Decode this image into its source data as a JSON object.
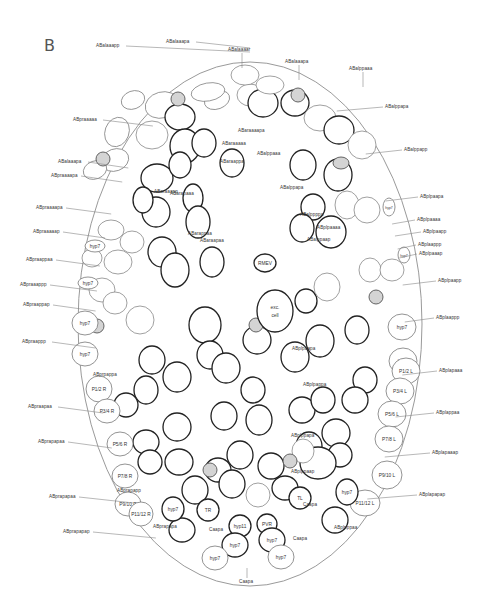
{
  "figure": {
    "panel_label": "B",
    "outline_color": "#9a9a9a",
    "cell_stroke_dark": "#222222",
    "cell_stroke_light": "#777777",
    "shaded_cell_fill": "#d4d4d4"
  },
  "outer_labels": {
    "left": [
      {
        "text": "ABalaaapp",
        "x": 96,
        "y": 44
      },
      {
        "text": "ABalaaapa",
        "x": 166,
        "y": 40
      },
      {
        "text": "ABpraaaaa",
        "x": 73,
        "y": 118
      },
      {
        "text": "ABalaaapa",
        "x": 58,
        "y": 160
      },
      {
        "text": "ABpraaaapa",
        "x": 51,
        "y": 174
      },
      {
        "text": "ABpraaaapa",
        "x": 36,
        "y": 206
      },
      {
        "text": "ABpraaaaap",
        "x": 33,
        "y": 230
      },
      {
        "text": "ABpraappaa",
        "x": 26,
        "y": 258
      },
      {
        "text": "ABpraaappp",
        "x": 20,
        "y": 283
      },
      {
        "text": "ABpraappap",
        "x": 23,
        "y": 303
      },
      {
        "text": "ABpraappp",
        "x": 22,
        "y": 340
      },
      {
        "text": "ABpraapaa",
        "x": 28,
        "y": 405
      },
      {
        "text": "ABprapapaa",
        "x": 38,
        "y": 440
      },
      {
        "text": "ABprapapaa",
        "x": 49,
        "y": 495
      },
      {
        "text": "ABprapapap",
        "x": 63,
        "y": 530
      }
    ],
    "top": [
      {
        "text": "ABalaaaar",
        "x": 228,
        "y": 48
      },
      {
        "text": "ABalaaapa",
        "x": 285,
        "y": 60
      },
      {
        "text": "ABalppaaa",
        "x": 349,
        "y": 67
      }
    ],
    "right": [
      {
        "text": "ABalppapa",
        "x": 385,
        "y": 105
      },
      {
        "text": "ABalppapp",
        "x": 404,
        "y": 148
      },
      {
        "text": "ABplpaapa",
        "x": 420,
        "y": 195
      },
      {
        "text": "ABplpaaaa",
        "x": 417,
        "y": 218
      },
      {
        "text": "ABplpaapp",
        "x": 423,
        "y": 230
      },
      {
        "text": "ABplaappp",
        "x": 418,
        "y": 243
      },
      {
        "text": "ABplpaaap",
        "x": 419,
        "y": 252
      },
      {
        "text": "ABplpaapp",
        "x": 438,
        "y": 279
      },
      {
        "text": "ABplaappp",
        "x": 436,
        "y": 316
      },
      {
        "text": "ABplapaaa",
        "x": 439,
        "y": 369
      },
      {
        "text": "ABplappaa",
        "x": 436,
        "y": 411
      },
      {
        "text": "ABplapaaap",
        "x": 432,
        "y": 451
      },
      {
        "text": "ABplapapap",
        "x": 419,
        "y": 493
      }
    ],
    "bottom": [
      {
        "text": "Caapa",
        "x": 239,
        "y": 580
      }
    ]
  },
  "inner_labels": [
    {
      "text": "ABaraaaapa",
      "x": 238,
      "y": 129
    },
    {
      "text": "ABaraaaaa",
      "x": 222,
      "y": 142
    },
    {
      "text": "ABarapaaa",
      "x": 170,
      "y": 192
    },
    {
      "text": "ABaraappa",
      "x": 220,
      "y": 160
    },
    {
      "text": "ABalppaaa",
      "x": 257,
      "y": 152
    },
    {
      "text": "ABalppapa",
      "x": 280,
      "y": 186
    },
    {
      "text": "ABarappaa",
      "x": 188,
      "y": 232
    },
    {
      "text": "ABaraapaa",
      "x": 200,
      "y": 239
    },
    {
      "text": "ABaraaapp",
      "x": 154,
      "y": 190
    },
    {
      "text": "ABalppppa",
      "x": 300,
      "y": 213
    },
    {
      "text": "ABplpaaaa",
      "x": 317,
      "y": 226
    },
    {
      "text": "ABalppaap",
      "x": 307,
      "y": 238
    },
    {
      "text": "ABplpaapa",
      "x": 292,
      "y": 347
    },
    {
      "text": "ABplpappa",
      "x": 303,
      "y": 383
    },
    {
      "text": "ABprpappa",
      "x": 93,
      "y": 373
    },
    {
      "text": "ABprapapp",
      "x": 117,
      "y": 489
    },
    {
      "text": "ABprapapa",
      "x": 153,
      "y": 525
    },
    {
      "text": "ABplppaap",
      "x": 291,
      "y": 470
    },
    {
      "text": "ABplppapa",
      "x": 291,
      "y": 434
    },
    {
      "text": "ABplpppaa",
      "x": 334,
      "y": 526
    }
  ],
  "named_cells": [
    {
      "text": "RMEV",
      "cx": 265,
      "cy": 263,
      "rx": 11,
      "ry": 9,
      "dark": true
    },
    {
      "text": "exc. cell",
      "cx": 275,
      "cy": 311,
      "rx": 18,
      "ry": 21,
      "dark": true
    },
    {
      "text": "hyp7",
      "cx": 85,
      "cy": 323,
      "rx": 13,
      "ry": 12,
      "dark": false
    },
    {
      "text": "hyp7",
      "cx": 85,
      "cy": 354,
      "rx": 13,
      "ry": 12,
      "dark": false
    },
    {
      "text": "hyp7",
      "cx": 402,
      "cy": 327,
      "rx": 14,
      "ry": 13,
      "dark": false
    },
    {
      "text": "hyp7",
      "cx": 403,
      "cy": 361,
      "rx": 14,
      "ry": 13,
      "dark": false
    },
    {
      "text": "P1/2 R",
      "cx": 99,
      "cy": 389,
      "rx": 13,
      "ry": 13,
      "dark": false
    },
    {
      "text": "P3/4 R",
      "cx": 107,
      "cy": 411,
      "rx": 13,
      "ry": 12,
      "dark": false
    },
    {
      "text": "P5/6 R",
      "cx": 120,
      "cy": 444,
      "rx": 13,
      "ry": 12,
      "dark": false
    },
    {
      "text": "P7/8 R",
      "cx": 125,
      "cy": 476,
      "rx": 13,
      "ry": 12,
      "dark": false
    },
    {
      "text": "P9/10 R",
      "cx": 128,
      "cy": 504,
      "rx": 13,
      "ry": 12,
      "dark": false
    },
    {
      "text": "P11/12 R",
      "cx": 141,
      "cy": 514,
      "rx": 12,
      "ry": 12,
      "dark": false
    },
    {
      "text": "P1/2 L",
      "cx": 406,
      "cy": 371,
      "rx": 14,
      "ry": 13,
      "dark": false
    },
    {
      "text": "P3/4 L",
      "cx": 400,
      "cy": 391,
      "rx": 14,
      "ry": 13,
      "dark": false
    },
    {
      "text": "P5/6 L",
      "cx": 392,
      "cy": 414,
      "rx": 14,
      "ry": 13,
      "dark": false
    },
    {
      "text": "P7/8 L",
      "cx": 389,
      "cy": 439,
      "rx": 14,
      "ry": 13,
      "dark": false
    },
    {
      "text": "P9/10 L",
      "cx": 387,
      "cy": 475,
      "rx": 15,
      "ry": 14,
      "dark": false
    },
    {
      "text": "P11/12 L",
      "cx": 365,
      "cy": 503,
      "rx": 15,
      "ry": 13,
      "dark": false
    },
    {
      "text": "hyp7",
      "cx": 173,
      "cy": 509,
      "rx": 11,
      "ry": 12,
      "dark": true
    },
    {
      "text": "TR",
      "cx": 208,
      "cy": 510,
      "rx": 11,
      "ry": 11,
      "dark": true
    },
    {
      "text": "TL",
      "cx": 300,
      "cy": 498,
      "rx": 11,
      "ry": 11,
      "dark": true
    },
    {
      "text": "hyp7",
      "cx": 347,
      "cy": 492,
      "rx": 11,
      "ry": 13,
      "dark": true
    },
    {
      "text": "hyp11",
      "cx": 240,
      "cy": 526,
      "rx": 11,
      "ry": 11,
      "dark": true
    },
    {
      "text": "PVR",
      "cx": 267,
      "cy": 524,
      "rx": 10,
      "ry": 10,
      "dark": true
    },
    {
      "text": "hyp7",
      "cx": 235,
      "cy": 545,
      "rx": 13,
      "ry": 12,
      "dark": true
    },
    {
      "text": "hyp7",
      "cx": 272,
      "cy": 540,
      "rx": 13,
      "ry": 12,
      "dark": true
    },
    {
      "text": "hyp7",
      "cx": 215,
      "cy": 558,
      "rx": 13,
      "ry": 12,
      "dark": false
    },
    {
      "text": "hyp7",
      "cx": 281,
      "cy": 557,
      "rx": 13,
      "ry": 12,
      "dark": false
    },
    {
      "text": "hyp7",
      "cx": 95,
      "cy": 246,
      "rx": 10,
      "ry": 6,
      "dark": false
    },
    {
      "text": "hyp7",
      "cx": 88,
      "cy": 283,
      "rx": 10,
      "ry": 6,
      "dark": false
    },
    {
      "text": "hyp7",
      "cx": 389,
      "cy": 207,
      "rx": 6,
      "ry": 9,
      "dark": false
    },
    {
      "text": "hyp7",
      "cx": 404,
      "cy": 255,
      "rx": 6,
      "ry": 8,
      "dark": false
    }
  ],
  "misc_labels": [
    {
      "text": "Caapa",
      "x": 303,
      "y": 503
    },
    {
      "text": "Caapa",
      "x": 209,
      "y": 528
    },
    {
      "text": "Caapa",
      "x": 293,
      "y": 537
    }
  ]
}
